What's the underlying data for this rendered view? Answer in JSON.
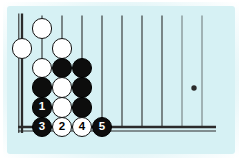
{
  "figure": {
    "kind": "go-board-diagram",
    "background_color": "#ffffff",
    "mat_color": "#d6f1f4",
    "line_color": "#2b2b2b",
    "black_stone_color": "#0d0d0d",
    "white_stone_color": "#ffffff"
  },
  "board": {
    "description": "Lower-left corner of a Go board, cropped on the top and right sides",
    "edges_shown": [
      "left",
      "bottom"
    ],
    "edge_style": "double-ruled thick border",
    "grid": {
      "origin_x": 22,
      "origin_y": 127,
      "col_spacing": 20,
      "row_spacing": 19.7,
      "columns_visible": 10,
      "rows_visible": 6
    },
    "star_point": {
      "col": 9,
      "row": 3,
      "x": 194,
      "y": 88
    }
  },
  "stones": [
    {
      "id": "w-c2r6",
      "color": "white",
      "col": 2,
      "row": 6,
      "label": ""
    },
    {
      "id": "w-c1r5",
      "color": "white",
      "col": 1,
      "row": 5,
      "label": ""
    },
    {
      "id": "w-c2r5b",
      "color": "white",
      "col": 3,
      "row": 5,
      "label": ""
    },
    {
      "id": "w-c2r4",
      "color": "white",
      "col": 2,
      "row": 4,
      "label": ""
    },
    {
      "id": "b-c3r4",
      "color": "black",
      "col": 3,
      "row": 4,
      "label": ""
    },
    {
      "id": "b-c4r4",
      "color": "black",
      "col": 4,
      "row": 4,
      "label": ""
    },
    {
      "id": "b-c2r3",
      "color": "black",
      "col": 2,
      "row": 3,
      "label": ""
    },
    {
      "id": "w-c3r3",
      "color": "white",
      "col": 3,
      "row": 3,
      "label": ""
    },
    {
      "id": "b-c4r3",
      "color": "black",
      "col": 4,
      "row": 3,
      "label": ""
    },
    {
      "id": "b-c2r2",
      "color": "black",
      "col": 2,
      "row": 2,
      "label": "1"
    },
    {
      "id": "w-c3r2",
      "color": "white",
      "col": 3,
      "row": 2,
      "label": ""
    },
    {
      "id": "b-c4r2",
      "color": "black",
      "col": 4,
      "row": 2,
      "label": ""
    },
    {
      "id": "b-c2r1",
      "color": "black",
      "col": 2,
      "row": 1,
      "label": "3"
    },
    {
      "id": "w-c3r1",
      "color": "white",
      "col": 3,
      "row": 1,
      "label": "2"
    },
    {
      "id": "w-c4r1",
      "color": "white",
      "col": 4,
      "row": 1,
      "label": "4"
    },
    {
      "id": "b-c5r1",
      "color": "black",
      "col": 5,
      "row": 1,
      "label": "5"
    }
  ],
  "move_sequence": [
    {
      "number": "1",
      "color": "black",
      "col": 2,
      "row": 2
    },
    {
      "number": "2",
      "color": "white",
      "col": 3,
      "row": 1
    },
    {
      "number": "3",
      "color": "black",
      "col": 2,
      "row": 1
    },
    {
      "number": "4",
      "color": "white",
      "col": 4,
      "row": 1
    },
    {
      "number": "5",
      "color": "black",
      "col": 5,
      "row": 1
    }
  ]
}
